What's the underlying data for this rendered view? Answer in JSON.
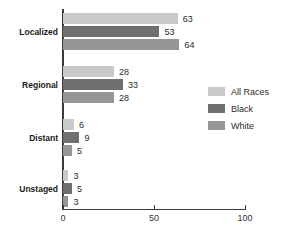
{
  "chart_data": {
    "type": "bar",
    "orientation": "horizontal",
    "title": "",
    "xlabel": "",
    "ylabel": "",
    "categories": [
      "Localized",
      "Regional",
      "Distant",
      "Unstaged"
    ],
    "series": [
      {
        "name": "All Races",
        "color": "#c9c9c9",
        "values": [
          63,
          28,
          6,
          3
        ]
      },
      {
        "name": "Black",
        "color": "#707070",
        "values": [
          53,
          33,
          9,
          5
        ]
      },
      {
        "name": "White",
        "color": "#969696",
        "values": [
          64,
          28,
          5,
          3
        ]
      }
    ],
    "xlim": [
      0,
      100
    ],
    "xticks": [
      0,
      50,
      100
    ],
    "xtick_labels": [
      "0",
      "50",
      "100"
    ],
    "grid": false,
    "legend_position": "right",
    "show_value_labels": true
  },
  "legend": {
    "entries": [
      {
        "label": "All Races"
      },
      {
        "label": "Black"
      },
      {
        "label": "White"
      }
    ]
  },
  "axis": {
    "ticks": [
      {
        "label": "0"
      },
      {
        "label": "50"
      },
      {
        "label": "100"
      }
    ]
  },
  "colors": {
    "all_races": "#c9c9c9",
    "black": "#707070",
    "white": "#969696",
    "axis": "#3a3a3a",
    "text": "#2b2b2b",
    "background": "#ffffff"
  }
}
